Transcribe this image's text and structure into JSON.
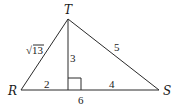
{
  "diagram": {
    "type": "triangle-with-altitude",
    "vertices": {
      "T": {
        "label": "T",
        "x": 68,
        "y": 19
      },
      "R": {
        "label": "R",
        "x": 21,
        "y": 90
      },
      "S": {
        "label": "S",
        "x": 159,
        "y": 90
      },
      "foot": {
        "x": 68,
        "y": 90
      }
    },
    "segment_labels": {
      "RT": "√13",
      "TS": "5",
      "altitude": "3",
      "R_to_foot": "2",
      "foot_to_S": "4",
      "RS": "6"
    },
    "right_angle_marker": true
  }
}
